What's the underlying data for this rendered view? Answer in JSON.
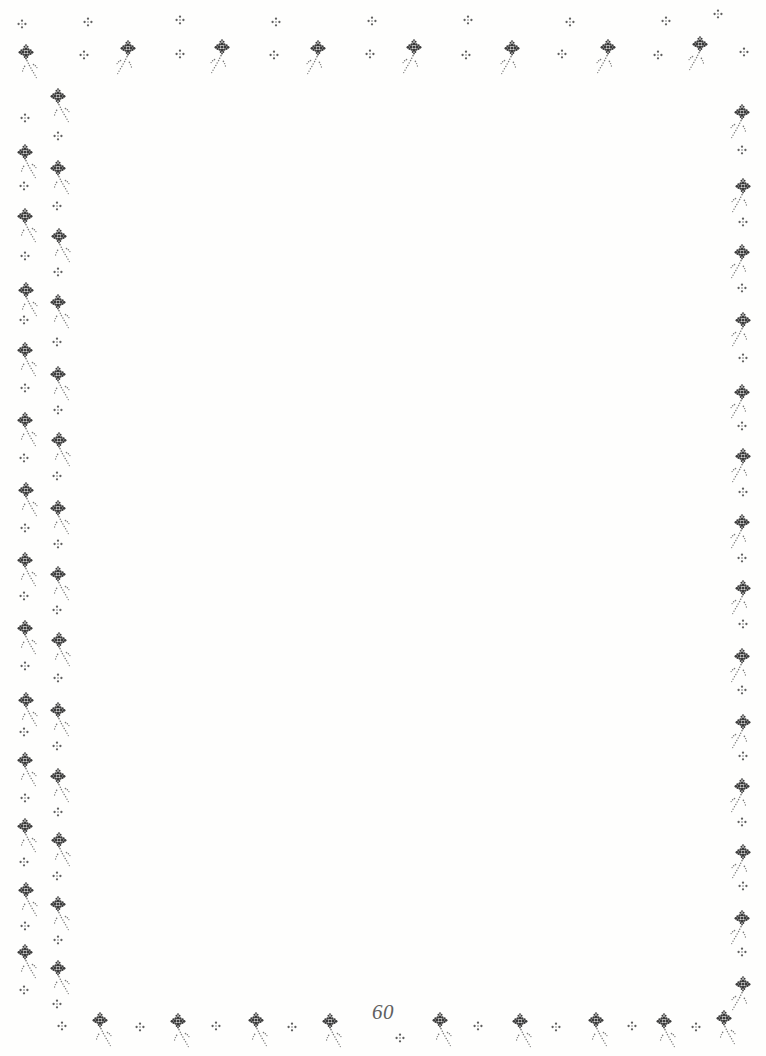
{
  "page": {
    "kind": "scanned-book-page",
    "page_number": "60",
    "background_color": "#fefefd",
    "ink_color": "#3a3a3a",
    "ink_color_light": "#6e6e6e",
    "body_text": "",
    "width": 766,
    "height": 1056
  },
  "border": {
    "name": "floral sprig stipple border",
    "motif_large": "flower-sprig-motif",
    "motif_small": "four-dot-cluster-motif",
    "ink_color": "#3a3a3a",
    "stem_color": "#777777",
    "edges": [
      "top",
      "left",
      "right",
      "bottom"
    ],
    "top": {
      "accent_row_y": 22,
      "flower_row_y": 48,
      "flower_xs": [
        128,
        222,
        318,
        414,
        512,
        608,
        700
      ],
      "accent_xs": [
        84,
        180,
        274,
        370,
        466,
        562,
        658,
        718
      ],
      "upper_accent_xs": [
        88,
        180,
        276,
        372,
        468,
        570,
        666,
        716
      ],
      "stem_direction": "down-left"
    },
    "left": {
      "outer_column_x": 25,
      "inner_column_x": 58,
      "outer_flower_ys": [
        152,
        216,
        290,
        350,
        420,
        490,
        560,
        628,
        700,
        760,
        826,
        890,
        952
      ],
      "inner_flower_ys": [
        118,
        188,
        252,
        318,
        382,
        450,
        520,
        584,
        650,
        718,
        782,
        848,
        912,
        978
      ],
      "stem_direction": "down-right"
    },
    "right": {
      "column_x": 742,
      "flower_ys": [
        112,
        186,
        252,
        320,
        392,
        456,
        522,
        588,
        656,
        722,
        786,
        852,
        918,
        984
      ],
      "stem_direction": "down-left"
    },
    "bottom": {
      "flower_row_y": 1020,
      "flower_xs": [
        100,
        178,
        256,
        330,
        440,
        520,
        596,
        664,
        724
      ],
      "accent_xs": [
        62,
        140,
        216,
        292,
        400,
        478,
        556,
        632,
        696,
        748
      ],
      "stem_direction": "down-right"
    }
  }
}
